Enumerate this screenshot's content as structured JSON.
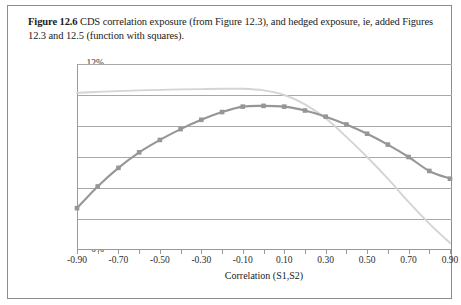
{
  "figure": {
    "label": "Figure 12.6",
    "caption": "CDS correlation exposure (from Figure 12.3), and hedged exposure, ie, added Figures 12.3 and 12.5 (function with squares)."
  },
  "colors": {
    "series_dark": "#969696",
    "series_light": "#d4d4d4",
    "gridline": "#a8a8a8",
    "axis": "#9a9a9a",
    "frame": "#8c8c8c",
    "text": "#1a1a1a"
  },
  "chart_data": {
    "type": "line",
    "title": "",
    "xlabel": "Correlation (S1,S2)",
    "ylabel": "Relative change",
    "x": [
      -0.9,
      -0.8,
      -0.7,
      -0.6,
      -0.5,
      -0.4,
      -0.3,
      -0.2,
      -0.1,
      0.0,
      0.1,
      0.2,
      0.3,
      0.4,
      0.5,
      0.6,
      0.7,
      0.8,
      0.9
    ],
    "xtick_labels": [
      "-0.90",
      "",
      "-0.70",
      "",
      "-0.50",
      "",
      "-0.30",
      "",
      "-0.10",
      "",
      "0.10",
      "",
      "0.30",
      "",
      "0.50",
      "",
      "0.70",
      "",
      "0.90"
    ],
    "xlim": [
      -0.95,
      0.95
    ],
    "ylim": [
      0,
      12
    ],
    "ytick_labels": [
      "0%",
      "2%",
      "4%",
      "6%",
      "8%",
      "10%",
      "12%"
    ],
    "ytick_values": [
      0,
      2,
      4,
      6,
      8,
      10,
      12
    ],
    "grid": true,
    "legend": "none",
    "series": [
      {
        "name": "CDS correlation exposure (from Figure 12.3)",
        "marker": "none",
        "color": "#d4d4d4",
        "values": [
          10.15,
          10.2,
          10.25,
          10.3,
          10.33,
          10.36,
          10.38,
          10.4,
          10.4,
          10.3,
          10.0,
          9.4,
          8.5,
          7.3,
          6.0,
          4.6,
          3.1,
          1.7,
          0.45
        ]
      },
      {
        "name": "Hedged exposure (added Figures 12.3 and 12.5), function with squares",
        "marker": "square",
        "color": "#969696",
        "values": [
          2.7,
          4.1,
          5.3,
          6.3,
          7.1,
          7.8,
          8.4,
          8.9,
          9.25,
          9.3,
          9.25,
          9.0,
          8.6,
          8.1,
          7.5,
          6.8,
          6.0,
          5.1,
          4.6
        ]
      }
    ]
  }
}
